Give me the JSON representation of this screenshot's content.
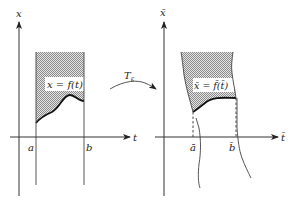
{
  "left_panel": {
    "y_axis_label": "x",
    "x_axis_label": "t",
    "left_bound_label": "a",
    "right_bound_label": "b",
    "region_label": "x = f(t)"
  },
  "transform": {
    "label": "T",
    "subscript": "ε"
  },
  "right_panel": {
    "y_axis_label": "x̄",
    "x_axis_label": "t̄",
    "left_bound_label": "ā",
    "right_bound_label": "b̄",
    "region_label": "x̄ = f̄(t̄)"
  },
  "colors": {
    "line": "#222222",
    "hatch": "#9a9a9a",
    "background": "#ffffff"
  }
}
